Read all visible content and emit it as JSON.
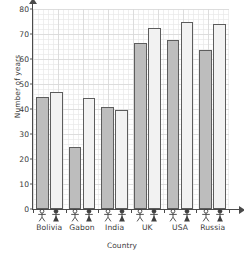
{
  "chart_data": {
    "type": "bar",
    "title": "",
    "xlabel": "Country",
    "ylabel": "Number of years",
    "categories": [
      "Bolivia",
      "Gabon",
      "India",
      "UK",
      "USA",
      "Russia"
    ],
    "series": [
      {
        "name": "Female",
        "icon": "female-stick-figure-icon",
        "color": "#bdbdbd",
        "values": [
          45,
          25,
          41,
          66.5,
          67.5,
          63.5
        ]
      },
      {
        "name": "Male",
        "icon": "male-stick-figure-icon",
        "color": "#f2f2f2",
        "values": [
          47,
          44.5,
          39.5,
          72.5,
          75,
          74
        ]
      }
    ],
    "ylim": [
      0,
      80
    ],
    "yticks": [
      0,
      10,
      20,
      30,
      40,
      50,
      60,
      70,
      80
    ],
    "ytick_labels": [
      "0",
      "10",
      "20",
      "30",
      "40",
      "50",
      "60",
      "70",
      "80"
    ],
    "y_minor_step": 2,
    "grid": true,
    "grid_color": "#d8d8d8",
    "grid_minor_color": "#e8e8e8",
    "legend": "none",
    "axis_color": "#4a4a4a",
    "bar_border_color": "#5d5d5d",
    "background": "#ffffff"
  }
}
